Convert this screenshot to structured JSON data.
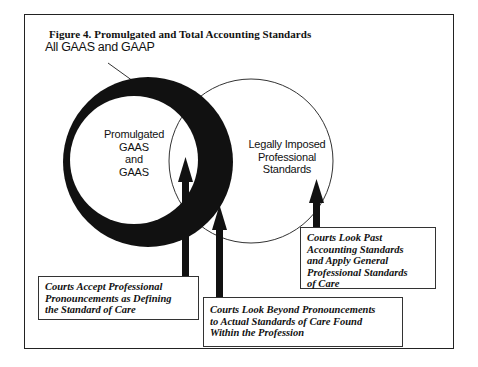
{
  "figure": {
    "title": "Figure 4.  Promulgated and Total Accounting Standards"
  },
  "labels": {
    "all_gaas_gaap": "All GAAS and GAAP",
    "promulgated": [
      "Promulgated",
      "GAAS",
      "and",
      "GAAS"
    ],
    "legally_imposed": [
      "Legally Imposed",
      "Professional",
      "Standards"
    ]
  },
  "callouts": {
    "accept": {
      "lines": [
        "Courts Accept Professional",
        "Pronouncements as Defining",
        "the Standard of Care"
      ]
    },
    "beyond": {
      "lines": [
        "Courts Look Beyond Pronouncements",
        "to Actual Standards of Care Found",
        "Within the Profession"
      ]
    },
    "past": {
      "lines": [
        "Courts Look Past",
        "Accounting Standards",
        "and Apply General",
        "Professional Standards",
        "of Care"
      ]
    }
  },
  "colors": {
    "ring": "#111111",
    "outline": "#333333",
    "background": "#ffffff"
  }
}
